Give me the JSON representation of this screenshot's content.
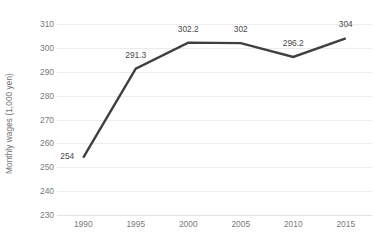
{
  "chart_data": {
    "type": "line",
    "title": "",
    "xlabel": "",
    "ylabel": "Monthly wages (1,000 yen)",
    "categories": [
      "1990",
      "1995",
      "2000",
      "2005",
      "2010",
      "2015"
    ],
    "values": [
      254,
      291.3,
      302.2,
      302,
      296.2,
      304
    ],
    "point_labels": [
      "254",
      "291.3",
      "302.2",
      "302",
      "296.2",
      "304"
    ],
    "ylim": [
      230,
      310
    ],
    "yticks": [
      "310",
      "300",
      "290",
      "280",
      "270",
      "260",
      "250",
      "240",
      "230"
    ],
    "ytick_values": [
      310,
      300,
      290,
      280,
      270,
      260,
      250,
      240,
      230
    ],
    "grid": "horizontal",
    "legend": "none",
    "series": [
      {
        "name": "Monthly wages",
        "values": [
          254,
          291.3,
          302.2,
          302,
          296.2,
          304
        ],
        "color": "#3f3f3f"
      }
    ],
    "colors": {
      "line": "#3f3f3f",
      "grid": "#ececec",
      "baseline": "#e2e2e2",
      "tick_text": "#7a7a7a",
      "axis_title_text": "#6e6e6e",
      "data_label_text": "#4a4a4a",
      "background": "#ffffff"
    }
  }
}
